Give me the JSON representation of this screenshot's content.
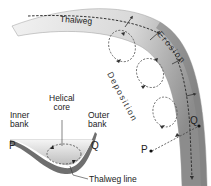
{
  "diagram": {
    "type": "meander-helical-flow",
    "labels": {
      "thalweg": "Thalweg",
      "erosion": "Erosion",
      "deposition": "Deposition",
      "inner_bank": [
        "Inner",
        "bank"
      ],
      "outer_bank": [
        "Outer",
        "bank"
      ],
      "helical_core": [
        "Helical",
        "core"
      ],
      "thalweg_line": "Thalweg line",
      "point_p": "P",
      "point_q": "Q",
      "point_p_plan": "P",
      "point_q_plan": "Q"
    },
    "colors": {
      "channel_light": "#e6e6e6",
      "channel_dark": "#8a8a8a",
      "dash": "#444444",
      "text": "#222222"
    }
  }
}
